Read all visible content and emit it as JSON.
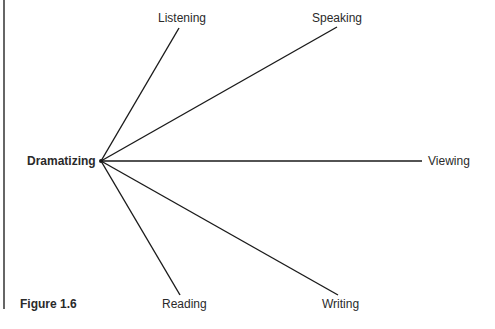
{
  "figure": {
    "caption": "Figure 1.6",
    "center": {
      "label": "Dramatizing",
      "x": 101,
      "y": 161
    },
    "spokes": [
      {
        "label": "Listening",
        "end_x": 179,
        "end_y": 28
      },
      {
        "label": "Speaking",
        "end_x": 337,
        "end_y": 27
      },
      {
        "label": "Viewing",
        "end_x": 422,
        "end_y": 161
      },
      {
        "label": "Reading",
        "end_x": 180,
        "end_y": 295
      },
      {
        "label": "Writing",
        "end_x": 338,
        "end_y": 295
      }
    ],
    "colors": {
      "line": "#1a1a1a",
      "text": "#2a2a2a",
      "background": "#ffffff"
    }
  }
}
